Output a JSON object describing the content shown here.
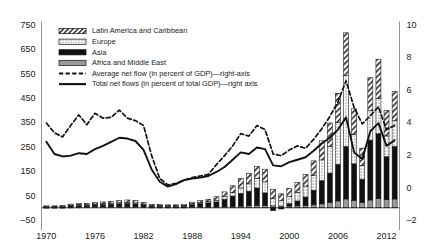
{
  "chart_data": {
    "type": "bar",
    "title": "",
    "subtitle": "",
    "xlabel": "",
    "ylabel": "",
    "y2label": "",
    "grid": false,
    "legend_position": "top-center",
    "ylim": [
      -50,
      750
    ],
    "y2lim": [
      -2,
      10
    ],
    "xlim": [
      1969.4,
      2013.6
    ],
    "y_ticks": [
      750,
      650,
      550,
      450,
      350,
      250,
      150,
      50,
      -50
    ],
    "y2_ticks": [
      10,
      8,
      6,
      4,
      2,
      0,
      -2
    ],
    "x_ticks": [
      1970,
      1976,
      1982,
      1988,
      1994,
      2000,
      2006,
      2012
    ],
    "x_tick_labels": [
      "1970",
      "1976",
      "1982",
      "1988",
      "1994",
      "2000",
      "2006",
      "2012"
    ],
    "y_tick_labels": [
      "750",
      "650",
      "550",
      "450",
      "350",
      "250",
      "150",
      "50",
      "–50"
    ],
    "y2_tick_labels": [
      "10",
      "8",
      "6",
      "4",
      "2",
      "0",
      "–2"
    ],
    "categories": [
      1970,
      1971,
      1972,
      1973,
      1974,
      1975,
      1976,
      1977,
      1978,
      1979,
      1980,
      1981,
      1982,
      1983,
      1984,
      1985,
      1986,
      1987,
      1988,
      1989,
      1990,
      1991,
      1992,
      1993,
      1994,
      1995,
      1996,
      1997,
      1998,
      1999,
      2000,
      2001,
      2002,
      2003,
      2004,
      2005,
      2006,
      2007,
      2008,
      2009,
      2010,
      2011,
      2012,
      2013
    ],
    "stacked": true,
    "series": [
      {
        "name": "Africa and Middle East",
        "pattern": "solid-gray",
        "color": "#9a9a9a",
        "axis": "left",
        "values": [
          2,
          2,
          2,
          3,
          4,
          4,
          5,
          5,
          5,
          6,
          6,
          5,
          4,
          3,
          3,
          3,
          3,
          3,
          4,
          4,
          4,
          4,
          5,
          6,
          7,
          8,
          9,
          9,
          8,
          7,
          7,
          8,
          9,
          12,
          16,
          22,
          28,
          36,
          30,
          22,
          32,
          38,
          34,
          36
        ]
      },
      {
        "name": "Asia",
        "pattern": "solid-black",
        "color": "#111111",
        "axis": "left",
        "values": [
          3,
          3,
          4,
          6,
          7,
          7,
          8,
          9,
          10,
          11,
          12,
          11,
          8,
          5,
          5,
          4,
          4,
          5,
          10,
          14,
          16,
          20,
          30,
          42,
          52,
          60,
          72,
          52,
          -12,
          -5,
          10,
          20,
          35,
          60,
          95,
          120,
          150,
          215,
          150,
          95,
          245,
          265,
          175,
          215
        ]
      },
      {
        "name": "Europe",
        "pattern": "dotted",
        "color": "#efefef",
        "axis": "left",
        "values": [
          1,
          1,
          1,
          2,
          2,
          2,
          3,
          3,
          3,
          4,
          4,
          4,
          3,
          2,
          2,
          2,
          2,
          2,
          3,
          4,
          5,
          7,
          10,
          14,
          22,
          30,
          40,
          45,
          30,
          22,
          28,
          35,
          45,
          60,
          85,
          110,
          170,
          290,
          120,
          55,
          120,
          145,
          85,
          105
        ]
      },
      {
        "name": "Latin America and Caribbean",
        "pattern": "hatch-diagonal",
        "color": "#ffffff",
        "axis": "left",
        "values": [
          2,
          2,
          3,
          4,
          5,
          5,
          6,
          7,
          8,
          9,
          10,
          10,
          7,
          4,
          4,
          3,
          3,
          4,
          6,
          8,
          10,
          14,
          20,
          28,
          38,
          42,
          48,
          52,
          38,
          28,
          35,
          40,
          48,
          60,
          78,
          95,
          120,
          175,
          105,
          72,
          135,
          160,
          105,
          120
        ]
      }
    ],
    "lines": [
      {
        "name": "Average net flow (in percent of GDP)—right-axis",
        "style": "dashed",
        "color": "#111111",
        "axis": "right",
        "values": [
          3.95,
          3.35,
          3.1,
          3.8,
          4.45,
          3.85,
          4.55,
          4.25,
          4.3,
          4.75,
          4.25,
          4.1,
          3.8,
          1.95,
          0.55,
          0.15,
          0.25,
          0.45,
          0.6,
          0.7,
          0.8,
          1.4,
          1.95,
          2.55,
          3.3,
          3.15,
          3.8,
          3.55,
          2.05,
          1.95,
          2.3,
          2.55,
          2.4,
          2.95,
          3.6,
          4.35,
          5.25,
          6.55,
          4.9,
          3.9,
          4.4,
          4.95,
          3.55,
          3.8
        ]
      },
      {
        "name": "Total net flows (in percent of total GDP)—right axis",
        "style": "solid",
        "color": "#111111",
        "axis": "right",
        "values": [
          2.8,
          2.05,
          1.9,
          1.95,
          2.1,
          2.05,
          2.35,
          2.55,
          2.8,
          3.05,
          3.0,
          2.85,
          2.3,
          1.1,
          0.35,
          0.05,
          0.2,
          0.45,
          0.55,
          0.6,
          0.7,
          0.95,
          1.25,
          1.7,
          2.15,
          2.05,
          2.45,
          2.35,
          1.35,
          1.3,
          1.55,
          1.7,
          1.85,
          2.25,
          2.7,
          3.05,
          3.55,
          4.3,
          2.15,
          1.75,
          3.45,
          3.95,
          2.55,
          2.9
        ]
      }
    ],
    "legend": [
      {
        "label": "Latin America and Caribbean",
        "swatch": "hatch-diagonal"
      },
      {
        "label": "Europe",
        "swatch": "dotted"
      },
      {
        "label": "Asia",
        "swatch": "solid-black"
      },
      {
        "label": "Africa and Middle East",
        "swatch": "solid-gray"
      },
      {
        "label": "Average net flow (in percent of GDP)—right-axis",
        "swatch": "dashed-line"
      },
      {
        "label": "Total net flows (in percent of total GDP)—right axis",
        "swatch": "solid-line"
      }
    ]
  }
}
